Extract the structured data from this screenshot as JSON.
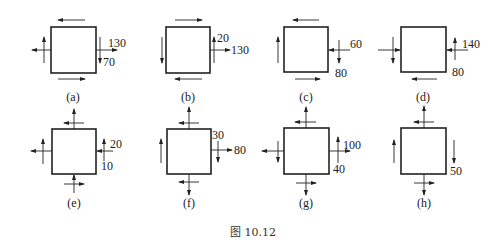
{
  "figure": {
    "caption": "图 10.12",
    "elements": [
      {
        "id": "a",
        "label": "(a)",
        "values": [
          "130",
          "70"
        ]
      },
      {
        "id": "b",
        "label": "(b)",
        "values": [
          "20",
          "130"
        ]
      },
      {
        "id": "c",
        "label": "(c)",
        "values": [
          "60",
          "80"
        ]
      },
      {
        "id": "d",
        "label": "(d)",
        "values": [
          "140",
          "80"
        ]
      },
      {
        "id": "e",
        "label": "(e)",
        "values": [
          "20",
          "10"
        ]
      },
      {
        "id": "f",
        "label": "(f)",
        "values": [
          "30",
          "80"
        ]
      },
      {
        "id": "g",
        "label": "(g)",
        "values": [
          "100",
          "40"
        ]
      },
      {
        "id": "h",
        "label": "(h)",
        "values": [
          "50"
        ]
      }
    ]
  }
}
